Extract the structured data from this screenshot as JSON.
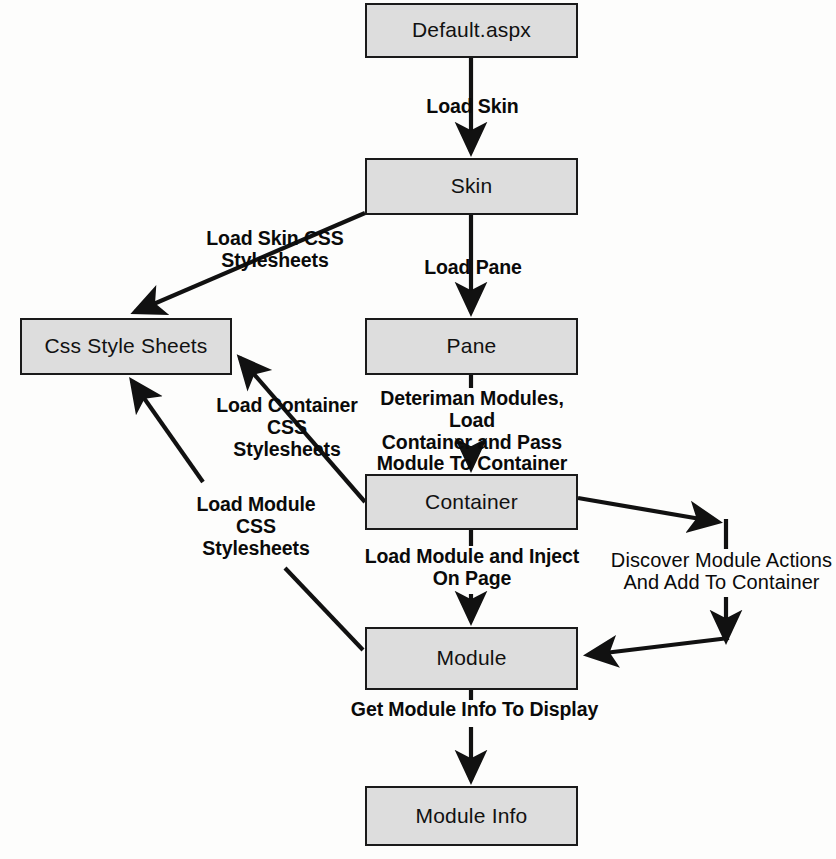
{
  "diagram": {
    "type": "flowchart",
    "colors": {
      "node_fill": "#dddddd",
      "node_border": "#1a1a1a",
      "edge": "#111111",
      "background": "#ffffff",
      "text": "#111111"
    },
    "nodes": [
      {
        "id": "default",
        "label": "Default.aspx",
        "x": 365,
        "y": 3,
        "w": 213,
        "h": 55
      },
      {
        "id": "skin",
        "label": "Skin",
        "x": 365,
        "y": 158,
        "w": 213,
        "h": 57
      },
      {
        "id": "css",
        "label": "Css Style Sheets",
        "x": 20,
        "y": 318,
        "w": 212,
        "h": 57
      },
      {
        "id": "pane",
        "label": "Pane",
        "x": 365,
        "y": 318,
        "w": 213,
        "h": 57
      },
      {
        "id": "container",
        "label": "Container",
        "x": 365,
        "y": 474,
        "w": 213,
        "h": 56
      },
      {
        "id": "module",
        "label": "Module",
        "x": 365,
        "y": 627,
        "w": 213,
        "h": 63
      },
      {
        "id": "moduleinfo",
        "label": "Module Info",
        "x": 365,
        "y": 786,
        "w": 213,
        "h": 60
      }
    ],
    "edges": [
      {
        "id": "default-to-skin",
        "from": "default",
        "to": "skin",
        "label": "Load Skin",
        "label_x": 425,
        "label_y": 96,
        "bold": true
      },
      {
        "id": "skin-to-css",
        "from": "skin",
        "to": "css",
        "label": "Load Skin CSS\nStylesheets",
        "label_x": 186,
        "label_y": 228,
        "bold": true
      },
      {
        "id": "skin-to-pane",
        "from": "skin",
        "to": "pane",
        "label": "Load Pane",
        "label_x": 420,
        "label_y": 257,
        "bold": true
      },
      {
        "id": "pane-to-container",
        "from": "pane",
        "to": "container",
        "label": "Deteriman Modules, Load\nContainer and Pass\nModule To Container",
        "label_x": 360,
        "label_y": 388,
        "bold": true
      },
      {
        "id": "container-to-css",
        "from": "container",
        "to": "css",
        "label": "Load Container\nCSS Stylesheets",
        "label_x": 212,
        "label_y": 395,
        "bold": true
      },
      {
        "id": "container-to-module",
        "from": "container",
        "to": "module",
        "label": "Load Module and Inject\nOn Page",
        "label_x": 362,
        "label_y": 546,
        "bold": true
      },
      {
        "id": "container-actions-to-module",
        "from": "container",
        "to": "module",
        "label": "Discover Module Actions\nAnd Add To Container",
        "label_x": 607,
        "label_y": 549,
        "bold": false
      },
      {
        "id": "module-to-css",
        "from": "module",
        "to": "css",
        "label": "Load Module\nCSS Stylesheets",
        "label_x": 181,
        "label_y": 494,
        "bold": true
      },
      {
        "id": "module-to-moduleinfo",
        "from": "module",
        "to": "moduleinfo",
        "label": "Get Module Info To Display",
        "label_x": 347,
        "label_y": 699,
        "bold": true
      }
    ]
  }
}
